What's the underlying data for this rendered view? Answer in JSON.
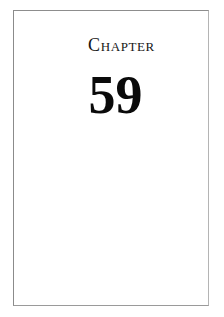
{
  "document": {
    "type": "book-chapter-opening-page",
    "page_background": "#ffffff",
    "frame": {
      "border_color": "#8d8d8d",
      "border_width_px": 1
    }
  },
  "chapter_opener": {
    "label": "Chapter",
    "number": "59",
    "label_color": "#161616",
    "number_color": "#0a0a0a"
  },
  "body": {
    "text": ""
  }
}
